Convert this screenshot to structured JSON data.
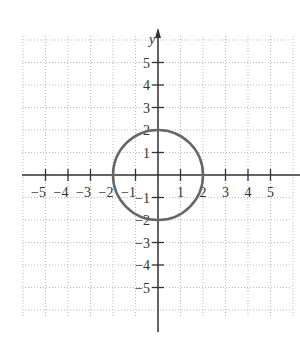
{
  "chart_data": {
    "type": "scatter",
    "title": "",
    "xlabel": "",
    "ylabel": "y",
    "xlim": [
      -6,
      6
    ],
    "ylim": [
      -6,
      6
    ],
    "grid": true,
    "x_ticks": [
      -5,
      -4,
      -3,
      -2,
      -1,
      1,
      2,
      3,
      4,
      5
    ],
    "y_ticks": [
      -5,
      -4,
      -3,
      -2,
      -1,
      1,
      2,
      3,
      4,
      5
    ],
    "series": [
      {
        "name": "circle",
        "shape": "circle",
        "center": [
          0,
          0
        ],
        "radius": 2,
        "equation": "x^2 + y^2 = 4",
        "color": "#666666"
      }
    ]
  },
  "axes": {
    "y_label": "y"
  },
  "colors": {
    "curve": "#666666",
    "axis": "#333333",
    "grid": "#bbbbbb"
  }
}
